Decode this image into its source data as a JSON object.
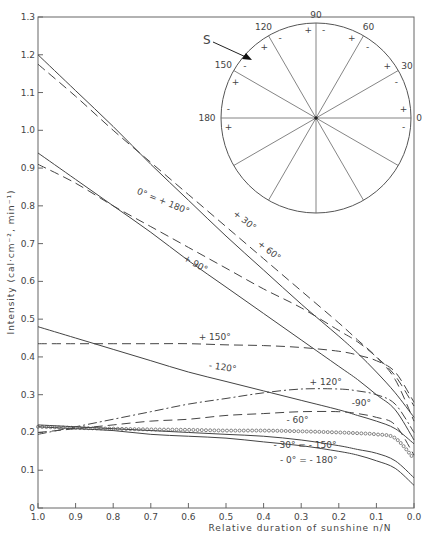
{
  "chart_data": {
    "type": "line",
    "title": "",
    "xlabel": "Relative duration of sunshine n/N",
    "ylabel": "Intensity (cal·cm⁻², min⁻¹)",
    "xlim": [
      1.0,
      0.0
    ],
    "ylim": [
      0,
      1.3
    ],
    "x_ticks": [
      "1.0",
      "0.9",
      "0.8",
      "0.7",
      "0.6",
      "0.5",
      "0.4",
      "0.3",
      "0.2",
      "0.1",
      "0.0"
    ],
    "y_ticks": [
      "0",
      "0.1",
      "0.2",
      "0.3",
      "0.4",
      "0.5",
      "0.6",
      "0.7",
      "0.8",
      "0.9",
      "1.0",
      "1.1",
      "1.2",
      "1.3"
    ],
    "grid": false,
    "x": [
      1.0,
      0.9,
      0.8,
      0.7,
      0.6,
      0.5,
      0.4,
      0.3,
      0.2,
      0.15,
      0.1,
      0.05,
      0.0
    ],
    "series": [
      {
        "name": "+30°",
        "style": "dashed",
        "values": [
          1.175,
          1.09,
          1.0,
          0.915,
          0.83,
          0.745,
          0.66,
          0.575,
          0.49,
          0.445,
          0.4,
          0.34,
          0.23
        ]
      },
      {
        "name": "+60°",
        "style": "solid",
        "values": [
          1.2,
          1.105,
          1.01,
          0.91,
          0.815,
          0.72,
          0.63,
          0.54,
          0.455,
          0.41,
          0.36,
          0.305,
          0.24
        ]
      },
      {
        "name": "0° = +180°",
        "style": "dashed",
        "values": [
          0.91,
          0.86,
          0.8,
          0.745,
          0.69,
          0.635,
          0.58,
          0.53,
          0.47,
          0.44,
          0.4,
          0.35,
          0.27
        ]
      },
      {
        "name": "+90°",
        "style": "solid",
        "values": [
          0.94,
          0.87,
          0.8,
          0.73,
          0.655,
          0.585,
          0.515,
          0.445,
          0.375,
          0.34,
          0.3,
          0.26,
          0.18
        ]
      },
      {
        "name": "+150°",
        "style": "dashed",
        "values": [
          0.435,
          0.435,
          0.435,
          0.435,
          0.435,
          0.432,
          0.43,
          0.425,
          0.415,
          0.405,
          0.39,
          0.36,
          0.28
        ]
      },
      {
        "name": "-120°",
        "style": "solid",
        "values": [
          0.48,
          0.45,
          0.42,
          0.39,
          0.36,
          0.335,
          0.31,
          0.285,
          0.26,
          0.245,
          0.23,
          0.21,
          0.17
        ]
      },
      {
        "name": "+120°",
        "style": "dashdot",
        "values": [
          0.195,
          0.215,
          0.235,
          0.255,
          0.275,
          0.29,
          0.305,
          0.315,
          0.315,
          0.31,
          0.3,
          0.275,
          0.2
        ]
      },
      {
        "name": "-90°",
        "style": "dashed",
        "values": [
          0.2,
          0.21,
          0.22,
          0.23,
          0.235,
          0.245,
          0.25,
          0.255,
          0.255,
          0.25,
          0.24,
          0.22,
          0.14
        ]
      },
      {
        "name": "-60°",
        "style": "circles",
        "values": [
          0.215,
          0.212,
          0.21,
          0.208,
          0.207,
          0.205,
          0.205,
          0.203,
          0.2,
          0.198,
          0.195,
          0.185,
          0.13
        ]
      },
      {
        "name": "-30° = -150°",
        "style": "solid",
        "values": [
          0.22,
          0.215,
          0.21,
          0.205,
          0.2,
          0.195,
          0.19,
          0.18,
          0.165,
          0.155,
          0.145,
          0.125,
          0.08
        ]
      },
      {
        "name": "-0° = -180°",
        "style": "solid",
        "values": [
          0.215,
          0.21,
          0.205,
          0.195,
          0.19,
          0.185,
          0.175,
          0.165,
          0.15,
          0.14,
          0.125,
          0.105,
          0.06
        ]
      }
    ],
    "annotations": [
      {
        "text": "+ 30°",
        "x": 0.455,
        "y": 0.755,
        "rotate": 38
      },
      {
        "text": "+ 60°",
        "x": 0.39,
        "y": 0.675,
        "rotate": 38
      },
      {
        "text": "0° = + 180°",
        "x": 0.67,
        "y": 0.805,
        "rotate": 22
      },
      {
        "text": "+ 90°",
        "x": 0.585,
        "y": 0.64,
        "rotate": 30
      },
      {
        "text": "+ 150°",
        "x": 0.53,
        "y": 0.445,
        "rotate": 0
      },
      {
        "text": "- 120°",
        "x": 0.51,
        "y": 0.365,
        "rotate": 8
      },
      {
        "text": "+ 120°",
        "x": 0.235,
        "y": 0.325,
        "rotate": 0
      },
      {
        "text": "-90°",
        "x": 0.14,
        "y": 0.27,
        "rotate": 0
      },
      {
        "text": "- 60°",
        "x": 0.31,
        "y": 0.225,
        "rotate": 0
      },
      {
        "text": "- 30° = - 150°",
        "x": 0.29,
        "y": 0.158,
        "rotate": 0
      },
      {
        "text": "- 0° = - 180°",
        "x": 0.28,
        "y": 0.12,
        "rotate": 0
      }
    ],
    "inset": {
      "type": "orientation-dial",
      "south_marker": "S",
      "angle_labels": [
        "0",
        "30",
        "60",
        "90",
        "120",
        "150",
        "180"
      ],
      "sign_markers": [
        "+",
        "-"
      ],
      "spokes_deg": [
        0,
        30,
        60,
        90,
        120,
        150,
        180,
        210,
        240,
        270,
        300,
        330
      ]
    }
  }
}
